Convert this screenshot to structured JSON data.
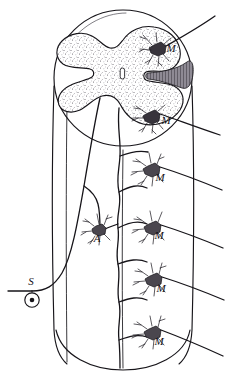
{
  "figure": {
    "style": "pen-and-ink histological drawing",
    "ink_color": "#17151a",
    "background_color": "#ffffff",
    "caption": ""
  },
  "labels": [
    {
      "id": "m1",
      "text": "M",
      "meaning": "motor neuron",
      "x": 171,
      "y": 52
    },
    {
      "id": "m2",
      "text": "M",
      "meaning": "motor neuron",
      "x": 166,
      "y": 124
    },
    {
      "id": "m3",
      "text": "M",
      "meaning": "motor neuron",
      "x": 160,
      "y": 181
    },
    {
      "id": "m4",
      "text": "M",
      "meaning": "motor neuron",
      "x": 159,
      "y": 239
    },
    {
      "id": "m5",
      "text": "M",
      "meaning": "motor neuron",
      "x": 161,
      "y": 292
    },
    {
      "id": "m6",
      "text": "M",
      "meaning": "motor neuron",
      "x": 159,
      "y": 345
    },
    {
      "id": "a1",
      "text": "A",
      "meaning": "association neuron",
      "x": 97,
      "y": 242
    },
    {
      "id": "s1",
      "text": "S",
      "meaning": "sensory ganglion cell",
      "x": 31,
      "y": 285
    }
  ],
  "structures": {
    "cord_outline": "elliptical cross-section of the spinal cord",
    "gray_matter": "butterfly-shaped stippled gray matter with dorsal and ventral horns",
    "central_canal": "small vertical oval at the centre of the gray commissure",
    "lateral_tract": "hatched wedge-shaped white-matter tract on the right flank",
    "cylinder": "longitudinal body of the cord drawn as a cylinder below the section",
    "descending_fiber": "long vertical fiber giving collateral branches to each motor neuron",
    "ventral_roots": "six motor axons leaving to the right at successive segments",
    "dorsal_root": "sensory fiber entering from the lower left"
  },
  "counts": {
    "motor_neurons": 6,
    "association_neurons": 1,
    "sensory_cells": 1,
    "exiting_roots": 6
  }
}
